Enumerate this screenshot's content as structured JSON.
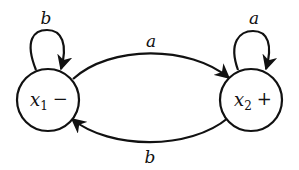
{
  "diagram": {
    "type": "finite-automaton",
    "states": [
      {
        "id": "x1",
        "name": "x",
        "subscript": "1",
        "marker": "−",
        "role": "start"
      },
      {
        "id": "x2",
        "name": "x",
        "subscript": "2",
        "marker": "+",
        "role": "final"
      }
    ],
    "transitions": [
      {
        "from": "x1",
        "to": "x1",
        "label": "b"
      },
      {
        "from": "x1",
        "to": "x2",
        "label": "a"
      },
      {
        "from": "x2",
        "to": "x2",
        "label": "a"
      },
      {
        "from": "x2",
        "to": "x1",
        "label": "b"
      }
    ],
    "colors": {
      "stroke": "#111111",
      "background": "#ffffff"
    }
  }
}
